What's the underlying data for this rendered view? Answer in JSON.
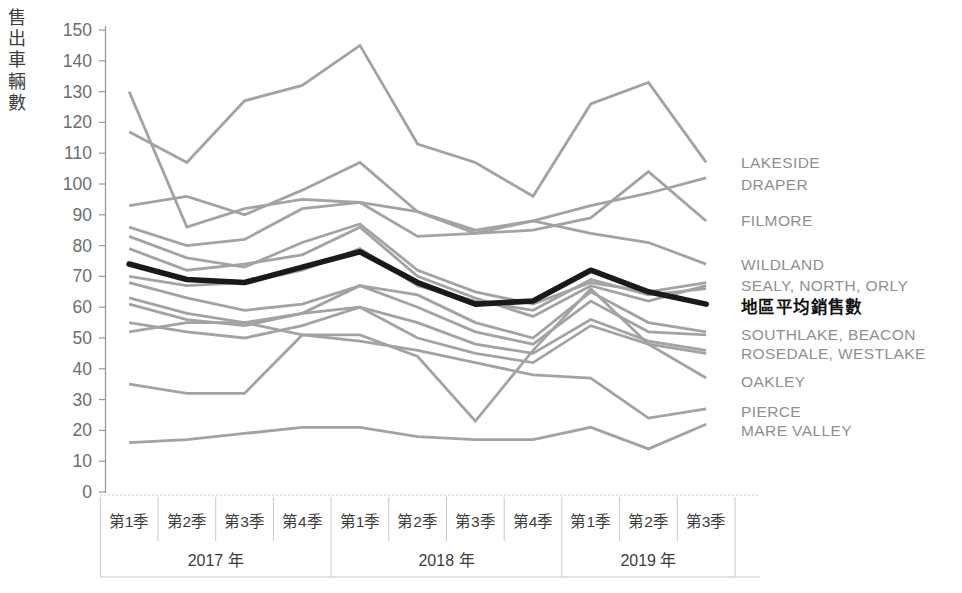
{
  "chart_data": {
    "type": "line",
    "title": "",
    "ylabel": "售出車輛數",
    "ylim": [
      0,
      150
    ],
    "yticks": [
      0,
      10,
      20,
      30,
      40,
      50,
      60,
      70,
      80,
      90,
      100,
      110,
      120,
      130,
      140,
      150
    ],
    "grid": false,
    "legend_position": "right-end-labels",
    "quarters": [
      "第1季",
      "第2季",
      "第3季",
      "第4季",
      "第1季",
      "第2季",
      "第3季",
      "第4季",
      "第1季",
      "第2季",
      "第3季"
    ],
    "years": [
      {
        "label": "2017 年",
        "quarters": 4
      },
      {
        "label": "2018 年",
        "quarters": 4
      },
      {
        "label": "2019 年",
        "quarters": 3
      }
    ],
    "series": [
      {
        "name": "LAKESIDE",
        "values": [
          117,
          107,
          127,
          132,
          145,
          113,
          107,
          96,
          126,
          133,
          107
        ]
      },
      {
        "name": "DRAPER",
        "values": [
          130,
          86,
          92,
          95,
          94,
          91,
          85,
          88,
          93,
          97,
          102
        ]
      },
      {
        "name": "FILMORE",
        "values": [
          93,
          96,
          90,
          98,
          107,
          91,
          84,
          85,
          89,
          104,
          88
        ]
      },
      {
        "name": "WILDLAND",
        "values": [
          86,
          80,
          82,
          92,
          94,
          83,
          84,
          88,
          84,
          81,
          74
        ]
      },
      {
        "name": "SEALY",
        "values": [
          83,
          76,
          73,
          81,
          87,
          72,
          65,
          61,
          68,
          65,
          68
        ]
      },
      {
        "name": "NORTH",
        "values": [
          79,
          72,
          74,
          77,
          86,
          70,
          63,
          57,
          67,
          62,
          67
        ]
      },
      {
        "name": "ORLY",
        "values": [
          70,
          67,
          68,
          72,
          79,
          67,
          62,
          59,
          69,
          64,
          66
        ]
      },
      {
        "name": "SOUTHLAKE",
        "values": [
          68,
          63,
          59,
          61,
          67,
          64,
          55,
          50,
          65,
          55,
          52
        ]
      },
      {
        "name": "BEACON",
        "values": [
          63,
          58,
          55,
          58,
          67,
          60,
          52,
          48,
          62,
          52,
          51
        ]
      },
      {
        "name": "ROSEDALE",
        "values": [
          61,
          56,
          54,
          58,
          60,
          55,
          48,
          45,
          56,
          49,
          46
        ]
      },
      {
        "name": "WESTLAKE",
        "values": [
          55,
          52,
          50,
          54,
          60,
          50,
          45,
          42,
          54,
          48,
          45
        ]
      },
      {
        "name": "PIERCE",
        "values": [
          52,
          55,
          55,
          51,
          49,
          46,
          42,
          38,
          37,
          24,
          27
        ]
      },
      {
        "name": "OAKLEY",
        "values": [
          35,
          32,
          32,
          51,
          51,
          44,
          23,
          46,
          66,
          48,
          37
        ]
      },
      {
        "name": "MARE VALLEY",
        "values": [
          16,
          17,
          19,
          21,
          21,
          18,
          17,
          17,
          21,
          14,
          22
        ]
      }
    ],
    "average_series": {
      "name": "地區平均銷售數",
      "values": [
        74,
        69,
        68,
        73,
        78,
        68,
        61,
        62,
        72,
        65,
        61
      ]
    },
    "end_labels": [
      {
        "text": "LAKESIDE",
        "value": 107,
        "emphasis": false
      },
      {
        "text": "DRAPER",
        "value": 100,
        "emphasis": false
      },
      {
        "text": "FILMORE",
        "value": 88,
        "emphasis": false
      },
      {
        "text": "WILDLAND",
        "value": 74,
        "emphasis": false
      },
      {
        "text": "SEALY, NORTH, ORLY",
        "value": 67,
        "emphasis": false
      },
      {
        "text": "地區平均銷售數",
        "value": 60,
        "emphasis": true
      },
      {
        "text": "SOUTHLAKE, BEACON",
        "value": 51,
        "emphasis": false
      },
      {
        "text": "ROSEDALE, WESTLAKE",
        "value": 45,
        "emphasis": false
      },
      {
        "text": "OAKLEY",
        "value": 36,
        "emphasis": false
      },
      {
        "text": "PIERCE",
        "value": 26,
        "emphasis": false
      },
      {
        "text": "MARE VALLEY",
        "value": 20,
        "emphasis": false
      }
    ],
    "colors": {
      "dealer_line": "#a3a3a3",
      "average_line": "#1a1a1a",
      "axis_line": "#9a9a9a",
      "table_border": "#c9c9c9",
      "tick_text": "#6e6e6e",
      "axis_text": "#3d3d3d",
      "end_label_gray": "#8f8f8f",
      "end_label_black": "#111111",
      "background": "#ffffff"
    }
  }
}
